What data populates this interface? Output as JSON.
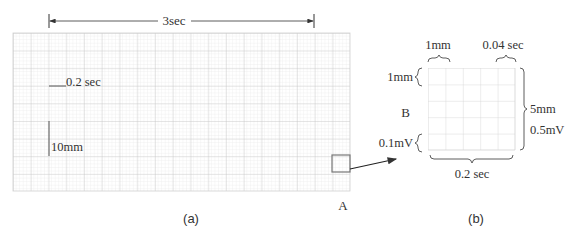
{
  "figure": {
    "panel_a": {
      "caption": "(a)",
      "span_label": "3sec",
      "horizontal_scale_label": "0.2 sec",
      "vertical_scale_label": "10mm",
      "region_marker_label": "A",
      "grid": {
        "large_columns": 19,
        "large_rows": 9,
        "small_per_large": 5
      }
    },
    "panel_b": {
      "caption": "(b)",
      "center_label": "B",
      "top_left_label": "1mm",
      "top_right_label": "0.04 sec",
      "left_top_label": "1mm",
      "left_bottom_label": "0.1mV",
      "right_labels": [
        "5mm",
        "0.5mV"
      ],
      "bottom_label": "0.2 sec",
      "grid": {
        "columns": 5,
        "rows": 5
      }
    },
    "colors": {
      "grid_minor": "#e6e6e6",
      "grid_major": "#c4c4c4",
      "ink": "#333333",
      "marker": "#777777"
    }
  }
}
